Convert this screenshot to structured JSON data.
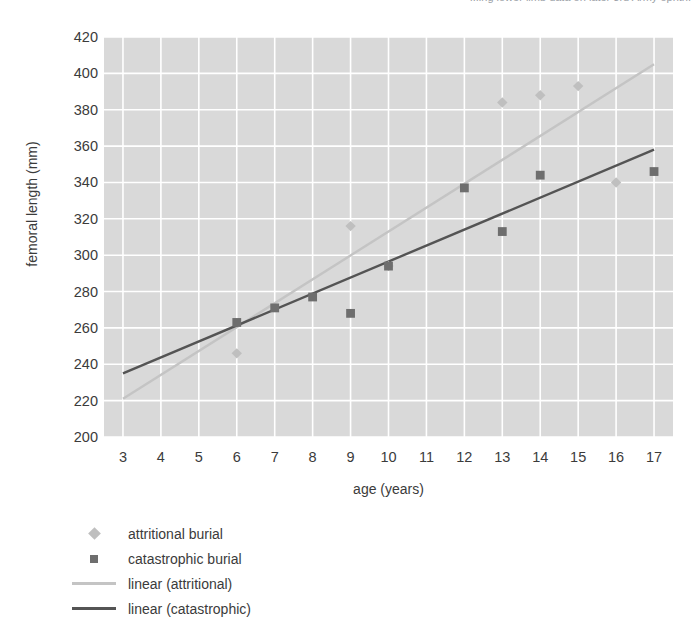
{
  "header": {
    "clipped_caption": "...ing lower limb data on later 3rd Army ophth."
  },
  "colors": {
    "plot_background": "#d9d9d9",
    "gridline": "#ffffff",
    "attritional_marker": "#bfbfbf",
    "catastrophic_marker": "#6e6e6e",
    "attritional_line": "#c4c4c4",
    "catastrophic_line": "#545454",
    "text": "#3b3b3b"
  },
  "chart_data": {
    "type": "scatter",
    "title": "",
    "xlabel": "age (years)",
    "ylabel": "femoral length (mm)",
    "xlim": [
      2.5,
      17.5
    ],
    "ylim": [
      200,
      420
    ],
    "xticks": [
      3,
      4,
      5,
      6,
      7,
      8,
      9,
      10,
      11,
      12,
      13,
      14,
      15,
      16,
      17
    ],
    "yticks": [
      200,
      220,
      240,
      260,
      280,
      300,
      320,
      340,
      360,
      380,
      400,
      420
    ],
    "grid": true,
    "legend_position": "below-left",
    "series": [
      {
        "name": "attritional burial",
        "marker": "diamond",
        "color": "#bfbfbf",
        "points": [
          {
            "x": 6,
            "y": 246
          },
          {
            "x": 9,
            "y": 316
          },
          {
            "x": 10,
            "y": 294
          },
          {
            "x": 13,
            "y": 384
          },
          {
            "x": 14,
            "y": 388
          },
          {
            "x": 15,
            "y": 393
          },
          {
            "x": 16,
            "y": 340
          }
        ]
      },
      {
        "name": "catastrophic burial",
        "marker": "square",
        "color": "#6e6e6e",
        "points": [
          {
            "x": 6,
            "y": 263
          },
          {
            "x": 7,
            "y": 271
          },
          {
            "x": 8,
            "y": 277
          },
          {
            "x": 9,
            "y": 268
          },
          {
            "x": 10,
            "y": 294
          },
          {
            "x": 12,
            "y": 337
          },
          {
            "x": 13,
            "y": 313
          },
          {
            "x": 14,
            "y": 344
          },
          {
            "x": 17,
            "y": 346
          }
        ]
      }
    ],
    "trendlines": [
      {
        "name": "linear (attritional)",
        "color": "#c4c4c4",
        "x_start": 3,
        "y_start": 221,
        "x_end": 17,
        "y_end": 405
      },
      {
        "name": "linear (catastrophic)",
        "color": "#545454",
        "x_start": 3,
        "y_start": 235,
        "x_end": 17,
        "y_end": 358
      }
    ],
    "legend": [
      {
        "label": "attritional burial",
        "key": "diamond",
        "color": "#bfbfbf"
      },
      {
        "label": "catastrophic burial",
        "key": "square",
        "color": "#6e6e6e"
      },
      {
        "label": "linear (attritional)",
        "key": "line",
        "color": "#c4c4c4"
      },
      {
        "label": "linear (catastrophic)",
        "key": "line",
        "color": "#545454"
      }
    ]
  }
}
